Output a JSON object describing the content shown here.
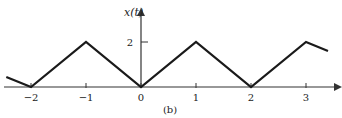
{
  "chart_data": {
    "type": "line",
    "title": "",
    "caption": "(b)",
    "ylabel": "x(t)",
    "xlabel": "",
    "x": [
      -2.45,
      -2,
      -1,
      0,
      1,
      2,
      3,
      3.4
    ],
    "values": [
      0.45,
      0,
      2,
      0,
      2,
      0,
      2,
      1.6
    ],
    "series": [
      {
        "name": "x(t)",
        "x": [
          -2.45,
          -2,
          -1,
          0,
          1,
          2,
          3,
          3.4
        ],
        "values": [
          0.45,
          0,
          2,
          0,
          2,
          0,
          2,
          1.6
        ]
      }
    ],
    "xticks": [
      -2,
      -1,
      0,
      1,
      2,
      3
    ],
    "xtick_labels": [
      "−2",
      "−1",
      "0",
      "1",
      "2",
      "3"
    ],
    "yticks": [
      2
    ],
    "ytick_labels": [
      "2"
    ],
    "xlim": [
      -2.55,
      3.6
    ],
    "ylim": [
      0,
      2.7
    ],
    "grid": false,
    "legend": "none"
  },
  "colors": {
    "line": "#1a1a1a",
    "axis": "#333333",
    "text": "#222222"
  }
}
